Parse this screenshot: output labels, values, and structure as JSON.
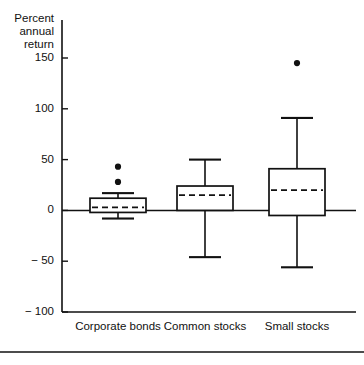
{
  "chart_data": {
    "type": "box",
    "title": "",
    "ylabel_lines": [
      "Percent",
      "annual",
      "return"
    ],
    "xlabel": "",
    "ylim": [
      -100,
      175
    ],
    "yticks": [
      150,
      100,
      50,
      0,
      -50,
      -100
    ],
    "ytick_labels": [
      "150",
      "100",
      "50",
      "0",
      "− 50",
      "− 100"
    ],
    "grid": false,
    "legend": "none",
    "zero_reference_line": 0,
    "categories": [
      "Corporate bonds",
      "Common stocks",
      "Small stocks"
    ],
    "boxes": [
      {
        "category": "Corporate bonds",
        "whisker_low": -8,
        "q1": -2,
        "median": 3,
        "q3": 12,
        "whisker_high": 17,
        "outliers": [
          28,
          43
        ]
      },
      {
        "category": "Common stocks",
        "whisker_low": -46,
        "q1": 0,
        "median": 15,
        "q3": 24,
        "whisker_high": 50,
        "outliers": []
      },
      {
        "category": "Small stocks",
        "whisker_low": -56,
        "q1": -5,
        "median": 20,
        "q3": 41,
        "whisker_high": 91,
        "outliers": [
          145
        ]
      }
    ],
    "colors": {
      "ink": "#111111",
      "background": "#ffffff"
    }
  }
}
